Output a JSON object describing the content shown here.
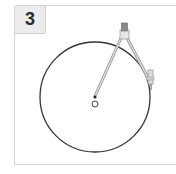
{
  "step": {
    "number": "3"
  },
  "diagram": {
    "circle": {
      "cx": 95,
      "cy": 97,
      "r": 55,
      "stroke": "#333333"
    },
    "center_point": {
      "cx": 95,
      "cy": 104,
      "r": 3
    },
    "compass": {
      "hinge": {
        "x": 124,
        "y": 32
      },
      "needle_tip": {
        "x": 95,
        "y": 97
      },
      "pencil_tip": {
        "x": 151,
        "y": 88
      },
      "color": "#a8a8a8"
    }
  }
}
